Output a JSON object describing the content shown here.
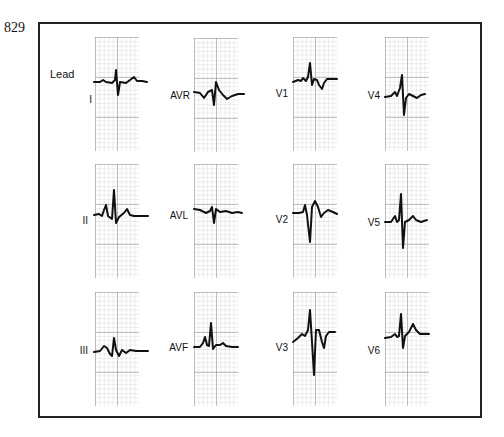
{
  "figure": {
    "number": "829",
    "lead_title": "Lead"
  },
  "leads": [
    {
      "id": "I",
      "label": "I"
    },
    {
      "id": "II",
      "label": "II"
    },
    {
      "id": "III",
      "label": "III"
    },
    {
      "id": "AVR",
      "label": "AVR"
    },
    {
      "id": "AVL",
      "label": "AVL"
    },
    {
      "id": "AVF",
      "label": "AVF"
    },
    {
      "id": "V1",
      "label": "V1"
    },
    {
      "id": "V2",
      "label": "V2"
    },
    {
      "id": "V3",
      "label": "V3"
    },
    {
      "id": "V4",
      "label": "V4"
    },
    {
      "id": "V5",
      "label": "V5"
    },
    {
      "id": "V6",
      "label": "V6"
    }
  ],
  "colors": {
    "trace": "#111111",
    "grid_major": "#969696",
    "grid_minor": "#c8c8c8",
    "frame": "#222222"
  }
}
